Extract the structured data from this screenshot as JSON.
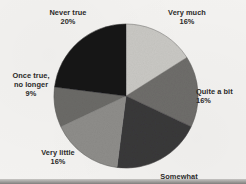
{
  "figure": {
    "background_color": "#f3f2f0",
    "width": 246,
    "height": 184
  },
  "chart_data": {
    "type": "pie",
    "title": "",
    "subtitle": "",
    "xlabel": "",
    "ylabel": "",
    "legend_position": "none",
    "grid": false,
    "labels_position": "outside",
    "start_angle_deg": 0,
    "direction": "clockwise",
    "center": {
      "x": 126,
      "y": 96
    },
    "radius": 72,
    "categories": [
      "Very much",
      "Quite a bit",
      "Somewhat",
      "Very little",
      "Once true, no longer",
      "Never true"
    ],
    "values": [
      16,
      16,
      20,
      16,
      9,
      20
    ],
    "value_suffix": "%",
    "slices": [
      {
        "label": "Very much",
        "percent_text": "16%",
        "value": 16,
        "color": "#c9c8c4",
        "start_deg": 0,
        "end_deg": 57.6
      },
      {
        "label": "Quite a bit",
        "percent_text": "16%",
        "value": 16,
        "color": "#6e6d6a",
        "start_deg": 57.6,
        "end_deg": 115.2
      },
      {
        "label": "Somewhat",
        "percent_text": "",
        "value": 20,
        "color": "#39383a",
        "start_deg": 115.2,
        "end_deg": 187.2
      },
      {
        "label": "Very little",
        "percent_text": "16%",
        "value": 16,
        "color": "#8e8d8a",
        "start_deg": 187.2,
        "end_deg": 244.8
      },
      {
        "label": "Once true, no longer",
        "percent_text": "9%",
        "value": 9,
        "color": "#6b6a67",
        "start_deg": 244.8,
        "end_deg": 277.2
      },
      {
        "label": "Never true",
        "percent_text": "20%",
        "value": 20,
        "color": "#171719",
        "start_deg": 277.2,
        "end_deg": 360
      }
    ]
  },
  "labels": {
    "very_much": {
      "name": "Very much",
      "pct": "16%"
    },
    "quite_a_bit": {
      "name": "Quite a bit",
      "pct": "16%"
    },
    "somewhat": {
      "name": "Somewhat",
      "pct": ""
    },
    "very_little": {
      "name": "Very little",
      "pct": "16%"
    },
    "once_true_line1": "Once true,",
    "once_true_line2": "no longer",
    "once_true_pct": "9%",
    "never_true": {
      "name": "Never true",
      "pct": "20%"
    }
  }
}
